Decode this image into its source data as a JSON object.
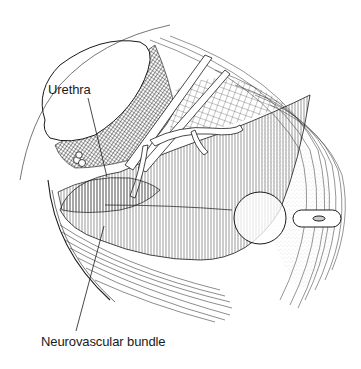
{
  "figure": {
    "type": "anatomical line illustration",
    "colors": {
      "ink": "#1a1a1a",
      "background": "#ffffff",
      "stipple": "#8a8a8a"
    },
    "labels": [
      {
        "id": "urethra",
        "text": "Urethra",
        "anchor": [
          48,
          90
        ],
        "leader_to": [
          107,
          177
        ]
      },
      {
        "id": "neurovascular_bundle",
        "text": "Neurovascular bundle",
        "anchor": [
          41,
          342
        ],
        "leader_to": [
          104,
          226
        ]
      }
    ]
  }
}
